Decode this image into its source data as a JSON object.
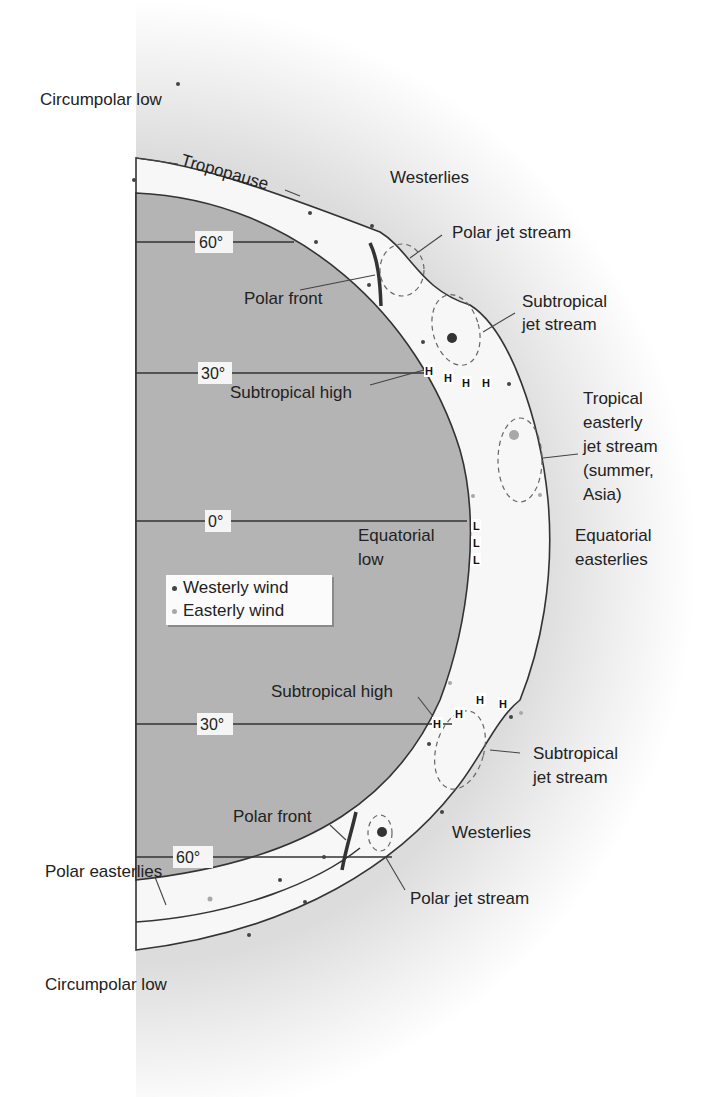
{
  "diagram": {
    "type": "atmospheric-circulation-cross-section",
    "latitude_labels": [
      {
        "id": "n60",
        "text": "60°"
      },
      {
        "id": "n30",
        "text": "30°"
      },
      {
        "id": "eq",
        "text": "0°"
      },
      {
        "id": "s30",
        "text": "30°"
      },
      {
        "id": "s60",
        "text": "60°"
      }
    ],
    "labels": {
      "circumpolar_low_north": "Circumpolar low",
      "tropopause": "Tropopause",
      "westerlies_north": "Westerlies",
      "polar_jet_stream_north": "Polar jet stream",
      "polar_front_north": "Polar front",
      "subtropical_jet_stream_north_l1": "Subtropical",
      "subtropical_jet_stream_north_l2": "jet stream",
      "subtropical_high_north": "Subtropical high",
      "tropical_easterly_l1": "Tropical",
      "tropical_easterly_l2": "easterly",
      "tropical_easterly_l3": "jet stream",
      "tropical_easterly_l4": "(summer,",
      "tropical_easterly_l5": "Asia)",
      "equatorial_low_l1": "Equatorial",
      "equatorial_low_l2": "low",
      "equatorial_easterlies_l1": "Equatorial",
      "equatorial_easterlies_l2": "easterlies",
      "subtropical_high_south": "Subtropical high",
      "subtropical_jet_stream_south_l1": "Subtropical",
      "subtropical_jet_stream_south_l2": "jet stream",
      "polar_front_south": "Polar front",
      "westerlies_south": "Westerlies",
      "polar_easterlies": "Polar easterlies",
      "polar_jet_stream_south": "Polar jet stream",
      "circumpolar_low_south": "Circumpolar low"
    },
    "pressure_markers": {
      "high_symbol": "H",
      "low_symbol": "L"
    },
    "legend": {
      "items": [
        {
          "label": "Westerly wind",
          "color": "#444444"
        },
        {
          "label": "Easterly wind",
          "color": "#a8a8a8"
        }
      ]
    },
    "colors": {
      "earth": "#b4b4b4",
      "troposphere": "#f7f7f7",
      "halo": "#d9d9d9",
      "line": "#333333",
      "westerly_dot": "#444444",
      "easterly_dot": "#a8a8a8"
    }
  }
}
